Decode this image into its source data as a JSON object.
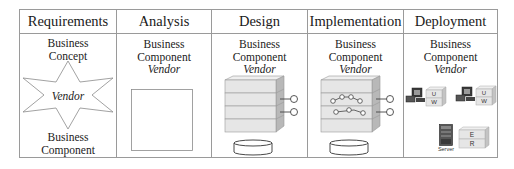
{
  "diagram": {
    "columns": [
      {
        "header": "Requirements",
        "top_lines": [
          "Business",
          "Concept"
        ],
        "shape": "six-pointed-star",
        "shape_label": "Vendor",
        "bottom_lines": [
          "Business",
          "Component"
        ]
      },
      {
        "header": "Analysis",
        "top_lines": [
          "Business",
          "Component"
        ],
        "vendor": "Vendor",
        "shape": "empty-square"
      },
      {
        "header": "Design",
        "top_lines": [
          "Business",
          "Component"
        ],
        "vendor": "Vendor",
        "shape": "layered-stack-with-interfaces-and-database"
      },
      {
        "header": "Implementation",
        "top_lines": [
          "Business",
          "Component"
        ],
        "vendor": "Vendor",
        "shape": "layered-stack-with-connected-nodes-interfaces-and-database"
      },
      {
        "header": "Deployment",
        "top_lines": [
          "Business",
          "Component"
        ],
        "vendor": "Vendor",
        "shape": "deployment-nodes",
        "workstation_boxes": [
          {
            "top": "U",
            "bottom": "W"
          },
          {
            "top": "U",
            "bottom": "W"
          }
        ],
        "server_box": {
          "top": "E",
          "bottom": "R"
        },
        "server_label": "Server"
      }
    ],
    "colors": {
      "border": "#9a9a9a",
      "layer_fill": "#e6e6e6",
      "layer_side": "#b8b8b8",
      "line": "#555555"
    }
  }
}
